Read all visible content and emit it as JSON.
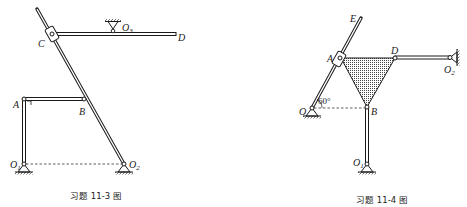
{
  "figures": [
    {
      "id": "fig-11-3",
      "caption": "习题 11-3 图",
      "labels": {
        "A": "A",
        "B": "B",
        "C": "C",
        "D": "D",
        "O1": "O",
        "O1_sub": "1",
        "O2": "O",
        "O2_sub": "2",
        "O3": "O",
        "O3_sub": "3"
      }
    },
    {
      "id": "fig-11-4",
      "caption": "习题 11-4 图",
      "labels": {
        "A": "A",
        "B": "B",
        "D": "D",
        "E": "E",
        "O": "O",
        "O1": "O",
        "O1_sub": "1",
        "O2": "O",
        "O2_sub": "2"
      },
      "angle": "60°"
    }
  ],
  "colors": {
    "ink": "#1a1a1a",
    "fill_dot": "#555555",
    "background": "#ffffff"
  }
}
